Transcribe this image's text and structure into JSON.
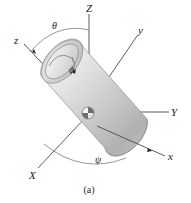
{
  "figure": {
    "caption": "(a)",
    "colors": {
      "background": "#ffffff",
      "axis": "#4a4a4a",
      "arc": "#6a6a6a",
      "label": "#1a1a1a",
      "body_light": "#f2f2f2",
      "body_mid": "#cfcfcf",
      "body_dark": "#a8a8a8",
      "body_outline": "#8d8d8d"
    }
  },
  "axes": {
    "fixed_frame": [
      {
        "name": "axis-Z",
        "label": "Z"
      },
      {
        "name": "axis-Y",
        "label": "Y"
      },
      {
        "name": "axis-X",
        "label": "X"
      }
    ],
    "body_frame": [
      {
        "name": "axis-z",
        "label": "z"
      },
      {
        "name": "axis-y",
        "label": "y"
      },
      {
        "name": "axis-x",
        "label": "x"
      }
    ]
  },
  "angles": [
    {
      "name": "angle-theta",
      "label": "θ"
    },
    {
      "name": "angle-phi",
      "label": "ϕ"
    },
    {
      "name": "angle-psi",
      "label": "ψ"
    }
  ],
  "markers": {
    "center_of_mass": "center-of-mass-marker"
  }
}
